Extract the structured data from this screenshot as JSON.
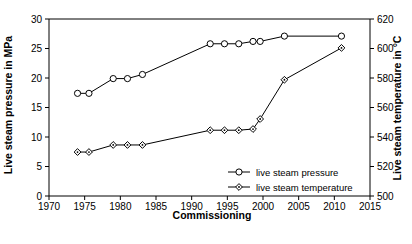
{
  "chart_data": {
    "type": "line",
    "title": "",
    "xlabel": "Commissioning",
    "ylabel": "Live steam pressure in MPa",
    "y2label": "Live steam temperature in °C",
    "xlim": [
      1970,
      2015
    ],
    "ylim": [
      0,
      30
    ],
    "y2lim": [
      500,
      620
    ],
    "xticks": [
      1970,
      1975,
      1980,
      1985,
      1990,
      1995,
      2000,
      2005,
      2010,
      2015
    ],
    "yticks": [
      0,
      5,
      10,
      15,
      20,
      25,
      30
    ],
    "y2ticks": [
      500,
      520,
      540,
      560,
      580,
      600,
      620
    ],
    "grid": false,
    "legend_position": "inside bottom-right",
    "series": [
      {
        "name": "live steam pressure",
        "axis": "left",
        "marker": "open-circle",
        "x": [
          1974.0,
          1975.6,
          1979.0,
          1981.0,
          1983.1,
          1992.6,
          1994.6,
          1996.6,
          1998.6,
          1999.6,
          2003.0,
          2011.0
        ],
        "values": [
          17.4,
          17.4,
          19.9,
          19.9,
          20.6,
          25.8,
          25.8,
          25.8,
          26.2,
          26.2,
          27.1,
          27.1
        ]
      },
      {
        "name": "live steam temperature",
        "axis": "right",
        "marker": "open-diamond",
        "x": [
          1974.0,
          1975.6,
          1979.0,
          1981.0,
          1983.1,
          1992.6,
          1994.6,
          1996.6,
          1998.6,
          1999.6,
          2003.0,
          2011.0
        ],
        "values": [
          529.8,
          529.8,
          534.6,
          534.6,
          534.6,
          544.6,
          544.6,
          544.6,
          545.4,
          552.2,
          578.8,
          600.4
        ]
      }
    ]
  },
  "legend": {
    "items": [
      {
        "label": "live steam pressure",
        "marker": "open-circle"
      },
      {
        "label": "live steam temperature",
        "marker": "open-diamond"
      }
    ]
  },
  "axes": {
    "x_title": "Commissioning",
    "y_left_title": "Live steam pressure in MPa",
    "y_right_title": "Live steam temperature in °C"
  }
}
